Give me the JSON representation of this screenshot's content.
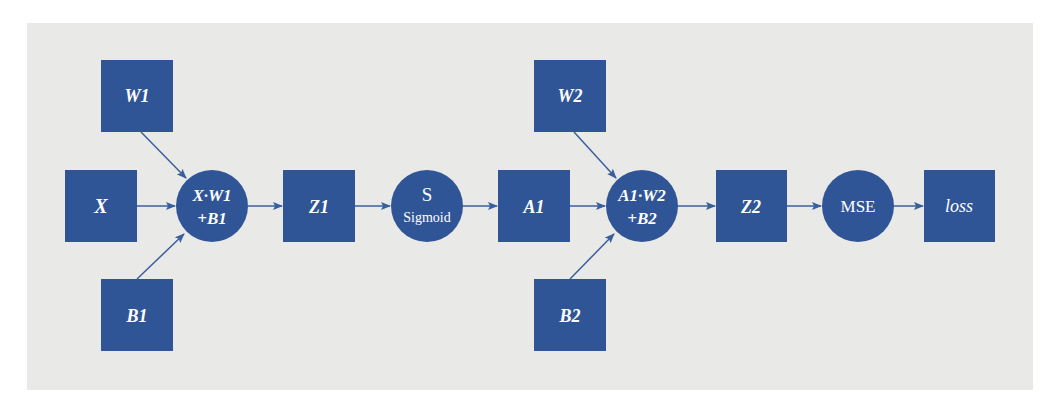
{
  "colors": {
    "node": "#2f5597",
    "edge": "#3a5f9e",
    "background": "#e9eae8",
    "text": "#ffffff"
  },
  "diagram": {
    "title": "",
    "nodes": {
      "x": {
        "label": "X",
        "shape": "square"
      },
      "w1": {
        "label": "W1",
        "shape": "square"
      },
      "b1": {
        "label": "B1",
        "shape": "square"
      },
      "op1": {
        "line1": "X·W1",
        "line2": "+B1",
        "shape": "circle"
      },
      "z1": {
        "label": "Z1",
        "shape": "square"
      },
      "sigmoid": {
        "line1": "S",
        "line2": "Sigmoid",
        "shape": "circle"
      },
      "a1": {
        "label": "A1",
        "shape": "square"
      },
      "w2": {
        "label": "W2",
        "shape": "square"
      },
      "b2": {
        "label": "B2",
        "shape": "square"
      },
      "op2": {
        "line1": "A1·W2",
        "line2": "+B2",
        "shape": "circle"
      },
      "z2": {
        "label": "Z2",
        "shape": "square"
      },
      "mse": {
        "label": "MSE",
        "shape": "circle"
      },
      "loss": {
        "label": "loss",
        "shape": "square"
      }
    },
    "edges": [
      [
        "X",
        "X·W1+B1"
      ],
      [
        "W1",
        "X·W1+B1"
      ],
      [
        "B1",
        "X·W1+B1"
      ],
      [
        "X·W1+B1",
        "Z1"
      ],
      [
        "Z1",
        "Sigmoid"
      ],
      [
        "Sigmoid",
        "A1"
      ],
      [
        "A1",
        "A1·W2+B2"
      ],
      [
        "W2",
        "A1·W2+B2"
      ],
      [
        "B2",
        "A1·W2+B2"
      ],
      [
        "A1·W2+B2",
        "Z2"
      ],
      [
        "Z2",
        "MSE"
      ],
      [
        "MSE",
        "loss"
      ]
    ]
  }
}
